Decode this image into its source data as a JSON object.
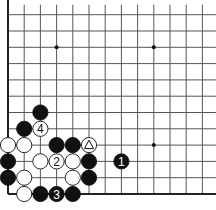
{
  "board": {
    "origin_x": 8,
    "origin_y": 194,
    "spacing_x": 16.2,
    "spacing_y": 16.3,
    "cols_visible": 13,
    "rows_visible": 12,
    "line_color": "#555555",
    "edge_color": "#222222",
    "star_points": [
      [
        3,
        9
      ],
      [
        9,
        9
      ],
      [
        9,
        3
      ]
    ]
  },
  "stones": [
    {
      "color": "black",
      "col": 2,
      "row": 5,
      "label": ""
    },
    {
      "color": "black",
      "col": 1,
      "row": 4,
      "label": ""
    },
    {
      "color": "white",
      "col": 2,
      "row": 4,
      "label": "4"
    },
    {
      "color": "white",
      "col": 0,
      "row": 3,
      "label": ""
    },
    {
      "color": "white",
      "col": 1,
      "row": 3,
      "label": ""
    },
    {
      "color": "black",
      "col": 3,
      "row": 3,
      "label": ""
    },
    {
      "color": "black",
      "col": 4,
      "row": 3,
      "label": ""
    },
    {
      "color": "white",
      "col": 5,
      "row": 3,
      "label": "triangle"
    },
    {
      "color": "black",
      "col": 0,
      "row": 2,
      "label": ""
    },
    {
      "color": "white",
      "col": 2,
      "row": 2,
      "label": ""
    },
    {
      "color": "white",
      "col": 3,
      "row": 2,
      "label": "2"
    },
    {
      "color": "white",
      "col": 4,
      "row": 2,
      "label": ""
    },
    {
      "color": "black",
      "col": 5,
      "row": 2,
      "label": ""
    },
    {
      "color": "black",
      "col": 7,
      "row": 2,
      "label": "1"
    },
    {
      "color": "black",
      "col": 0,
      "row": 1,
      "label": ""
    },
    {
      "color": "white",
      "col": 1,
      "row": 1,
      "label": ""
    },
    {
      "color": "white",
      "col": 4,
      "row": 1,
      "label": ""
    },
    {
      "color": "black",
      "col": 5,
      "row": 1,
      "label": ""
    },
    {
      "color": "white",
      "col": 1,
      "row": 0,
      "label": ""
    },
    {
      "color": "black",
      "col": 2,
      "row": 0,
      "label": ""
    },
    {
      "color": "black",
      "col": 3,
      "row": 0,
      "label": "3"
    },
    {
      "color": "black",
      "col": 4,
      "row": 0,
      "label": ""
    }
  ]
}
